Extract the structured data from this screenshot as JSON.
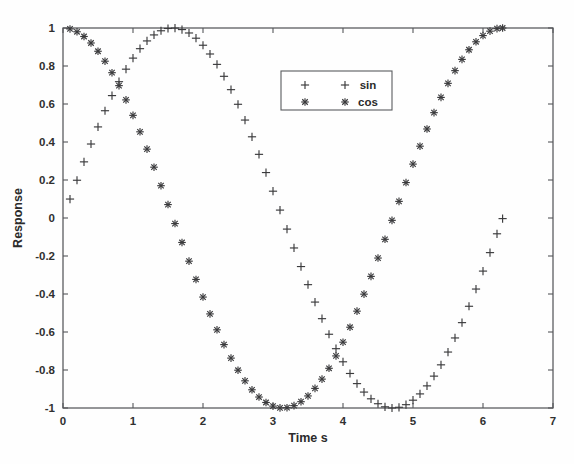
{
  "chart_data": {
    "type": "scatter",
    "title": "",
    "xlabel": "Time s",
    "ylabel": "Response",
    "xlim": [
      0,
      7
    ],
    "ylim": [
      -1,
      1
    ],
    "xticks": [
      0,
      1,
      2,
      3,
      4,
      5,
      6,
      7
    ],
    "xticklabels": [
      "0",
      "1",
      "2",
      "3",
      "4",
      "5",
      "6",
      "7"
    ],
    "yticks": [
      -1,
      -0.8,
      -0.6,
      -0.4,
      -0.2,
      0,
      0.2,
      0.4,
      0.6,
      0.8,
      1
    ],
    "yticklabels": [
      "-1",
      "-0.8",
      "-0.6",
      "-0.4",
      "-0.2",
      "0",
      "0.2",
      "0.4",
      "0.6",
      "0.8",
      "1"
    ],
    "grid": false,
    "legend_position": "upper-center-right",
    "x": [
      0.1,
      0.2,
      0.3,
      0.4,
      0.5,
      0.6,
      0.7,
      0.8,
      0.9,
      1.0,
      1.1,
      1.2,
      1.3,
      1.4,
      1.5,
      1.6,
      1.7,
      1.8,
      1.9,
      2.0,
      2.1,
      2.2,
      2.3,
      2.4,
      2.5,
      2.6,
      2.7,
      2.8,
      2.9,
      3.0,
      3.1,
      3.2,
      3.3,
      3.4,
      3.5,
      3.6,
      3.7,
      3.8,
      3.9,
      4.0,
      4.1,
      4.2,
      4.3,
      4.4,
      4.5,
      4.6,
      4.7,
      4.8,
      4.9,
      5.0,
      5.1,
      5.2,
      5.3,
      5.4,
      5.5,
      5.6,
      5.7,
      5.8,
      5.9,
      6.0,
      6.1,
      6.2,
      6.28
    ],
    "series": [
      {
        "name": "sin",
        "marker": "plus",
        "color": "#3a3a3c",
        "values": [
          0.0998,
          0.1987,
          0.2955,
          0.3894,
          0.4794,
          0.5646,
          0.6442,
          0.7174,
          0.7833,
          0.8415,
          0.8912,
          0.932,
          0.9636,
          0.9854,
          0.9975,
          0.9996,
          0.9917,
          0.9738,
          0.9463,
          0.9093,
          0.8632,
          0.8085,
          0.7457,
          0.6755,
          0.5985,
          0.5155,
          0.4274,
          0.335,
          0.2392,
          0.1411,
          0.0416,
          -0.0584,
          -0.1577,
          -0.2555,
          -0.3508,
          -0.4425,
          -0.5298,
          -0.6119,
          -0.6878,
          -0.7568,
          -0.8183,
          -0.8716,
          -0.9162,
          -0.9516,
          -0.9775,
          -0.9937,
          -0.9999,
          -0.9962,
          -0.9825,
          -0.9589,
          -0.9258,
          -0.8835,
          -0.8323,
          -0.7728,
          -0.7055,
          -0.6313,
          -0.5507,
          -0.4646,
          -0.3739,
          -0.2794,
          -0.1822,
          -0.0831,
          -0.0032
        ]
      },
      {
        "name": "cos",
        "marker": "star",
        "color": "#3a3a3c",
        "values": [
          0.995,
          0.9801,
          0.9553,
          0.9211,
          0.8776,
          0.8253,
          0.7648,
          0.6967,
          0.6216,
          0.5403,
          0.4536,
          0.3624,
          0.2675,
          0.17,
          0.0707,
          -0.0292,
          -0.1288,
          -0.2272,
          -0.3233,
          -0.4161,
          -0.5048,
          -0.5885,
          -0.6663,
          -0.7374,
          -0.8011,
          -0.8569,
          -0.9041,
          -0.9422,
          -0.971,
          -0.99,
          -0.9991,
          -0.9983,
          -0.9875,
          -0.9668,
          -0.9365,
          -0.8968,
          -0.8481,
          -0.791,
          -0.7259,
          -0.6536,
          -0.5748,
          -0.4903,
          -0.4008,
          -0.3073,
          -0.2108,
          -0.1122,
          -0.0124,
          0.0875,
          0.1865,
          0.2837,
          0.378,
          0.4685,
          0.5544,
          0.6347,
          0.7087,
          0.7756,
          0.8347,
          0.8855,
          0.9275,
          0.9602,
          0.9833,
          0.9965,
          1.0
        ]
      }
    ]
  },
  "legend": {
    "entries": [
      {
        "label": "sin",
        "marker": "plus"
      },
      {
        "label": "cos",
        "marker": "star"
      }
    ]
  },
  "axes": {
    "x_title": "Time s",
    "y_title": "Response"
  }
}
